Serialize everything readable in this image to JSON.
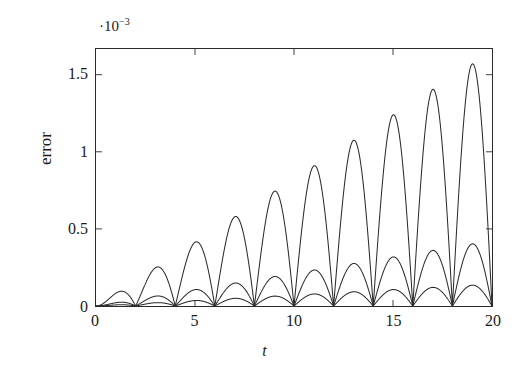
{
  "chart_data": {
    "type": "line",
    "title": "",
    "subtitle": "",
    "xlabel": "t",
    "ylabel": "error",
    "y_multiplier": "·10",
    "y_multiplier_exponent": "−3",
    "y_multiplier_text": "·10^-3",
    "xlim": [
      0,
      20
    ],
    "ylim": [
      0,
      1.6666
    ],
    "y_scale_factor": 0.001,
    "grid": false,
    "legend": null,
    "legend_position": "none",
    "axis_box": true,
    "ticks_direction": "in",
    "xticks": [
      0,
      5,
      10,
      15,
      20
    ],
    "xtick_labels": [
      "0",
      "5",
      "10",
      "15",
      "20"
    ],
    "x_minor_ticks": [],
    "yticks": [
      0,
      0.5,
      1,
      1.5
    ],
    "ytick_labels": [
      "0",
      "0.5",
      "1",
      "1.5"
    ],
    "line_color": "#2b2b2b",
    "background_color": "#ffffff",
    "oscillation_period": 2,
    "node_positions": [
      0,
      2,
      4,
      6,
      8,
      10,
      12,
      14,
      16,
      18,
      20
    ],
    "peak_positions": [
      1,
      3,
      5,
      7,
      9,
      11,
      13,
      15,
      17,
      19
    ],
    "series": [
      {
        "name": "curve-1",
        "description": "largest amplitude, linear growth envelope",
        "envelope_slope_per_unit_t": 0.0826,
        "peak_x": [
          1,
          3,
          5,
          7,
          9,
          11,
          13,
          15,
          17,
          19
        ],
        "peak_values": [
          0.083,
          0.248,
          0.413,
          0.578,
          0.743,
          0.909,
          1.074,
          1.239,
          1.404,
          1.569
        ]
      },
      {
        "name": "curve-2",
        "description": "medium amplitude, linear growth envelope",
        "envelope_slope_per_unit_t": 0.0212,
        "peak_x": [
          1,
          3,
          5,
          7,
          9,
          11,
          13,
          15,
          17,
          19
        ],
        "peak_values": [
          0.021,
          0.064,
          0.106,
          0.148,
          0.191,
          0.233,
          0.276,
          0.318,
          0.36,
          0.403
        ]
      },
      {
        "name": "curve-3",
        "description": "smallest amplitude, linear growth envelope",
        "envelope_slope_per_unit_t": 0.0071,
        "peak_x": [
          1,
          3,
          5,
          7,
          9,
          11,
          13,
          15,
          17,
          19
        ],
        "peak_values": [
          0.007,
          0.021,
          0.036,
          0.05,
          0.064,
          0.078,
          0.092,
          0.107,
          0.121,
          0.135
        ]
      }
    ]
  }
}
